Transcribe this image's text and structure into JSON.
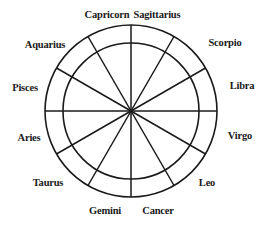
{
  "diagram": {
    "center": [
      131,
      111
    ],
    "outer_radius": 86,
    "inner_radius": 68,
    "stroke_color": "#1a1a1a",
    "signs": [
      {
        "name": "Capricorn",
        "x": 107,
        "y": 14
      },
      {
        "name": "Sagittarius",
        "x": 155,
        "y": 14
      },
      {
        "name": "Scorpio",
        "x": 225,
        "y": 42
      },
      {
        "name": "Libra",
        "x": 240,
        "y": 84
      },
      {
        "name": "Virgo",
        "x": 240,
        "y": 135
      },
      {
        "name": "Leo",
        "x": 207,
        "y": 182
      },
      {
        "name": "Cancer",
        "x": 155,
        "y": 210
      },
      {
        "name": "Gemini",
        "x": 107,
        "y": 210
      },
      {
        "name": "Taurus",
        "x": 49,
        "y": 182
      },
      {
        "name": "Aries",
        "x": 30,
        "y": 137
      },
      {
        "name": "Pisces",
        "x": 24,
        "y": 86
      },
      {
        "name": "Aquarius",
        "x": 45,
        "y": 44
      }
    ]
  }
}
